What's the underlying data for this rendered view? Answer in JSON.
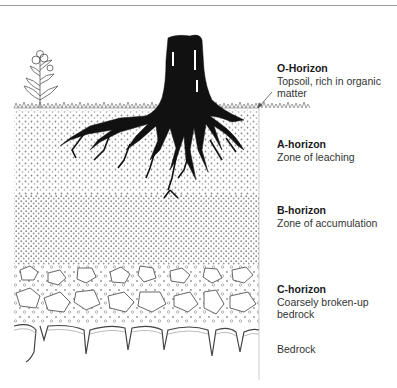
{
  "figure": {
    "type": "soil-profile-diagram",
    "colors": {
      "root": "#111111",
      "particle": "#8a8a8a",
      "rock_outline": "#555555",
      "rule": "#9a9a9a"
    }
  },
  "horizons": [
    {
      "id": "o",
      "title": "O-Horizon",
      "desc_lines": [
        "Topsoil, rich in organic matter"
      ]
    },
    {
      "id": "a",
      "title": "A-horizon",
      "desc_lines": [
        "Zone of leaching"
      ]
    },
    {
      "id": "b",
      "title": "B-horizon",
      "desc_lines": [
        "Zone of accumulation"
      ]
    },
    {
      "id": "c",
      "title": "C-horizon",
      "desc_lines": [
        "Coarsely broken-up",
        "bedrock"
      ]
    },
    {
      "id": "bedrock",
      "title": "",
      "desc_lines": [
        "Bedrock"
      ]
    }
  ]
}
